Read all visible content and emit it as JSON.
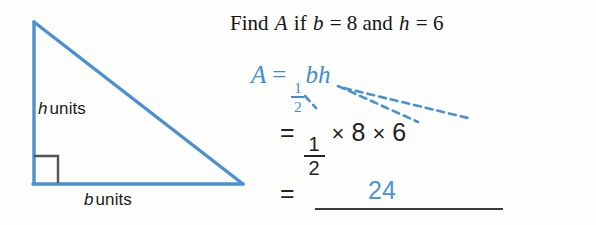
{
  "colors": {
    "figure_blue": "#4a90d2",
    "formula_blue": "#3f8ed4",
    "answer_blue": "#4a94d8",
    "ink_black": "#232323",
    "background": "#fdfdfc",
    "right_angle_gray": "#555555"
  },
  "figure": {
    "shape": "right-triangle",
    "height_label": {
      "variable": "h",
      "unit_text": "units"
    },
    "base_label": {
      "variable": "b",
      "unit_text": "units"
    },
    "right_angle_marker": true
  },
  "prompt": {
    "find_text": "Find",
    "area_symbol": "A",
    "if_text": "if",
    "base_symbol": "b",
    "equals": "=",
    "base_value": "8",
    "and_text": "and",
    "height_symbol": "h",
    "height_value": "6"
  },
  "work": {
    "formula": {
      "lhs": "A",
      "equals": "=",
      "numerator": "1",
      "denominator": "2",
      "variables": "bh"
    },
    "substitution": {
      "equals": "=",
      "numerator": "1",
      "denominator": "2",
      "times": "×",
      "base_value": "8",
      "height_value": "6"
    },
    "result": {
      "equals": "=",
      "answer": "24"
    }
  }
}
